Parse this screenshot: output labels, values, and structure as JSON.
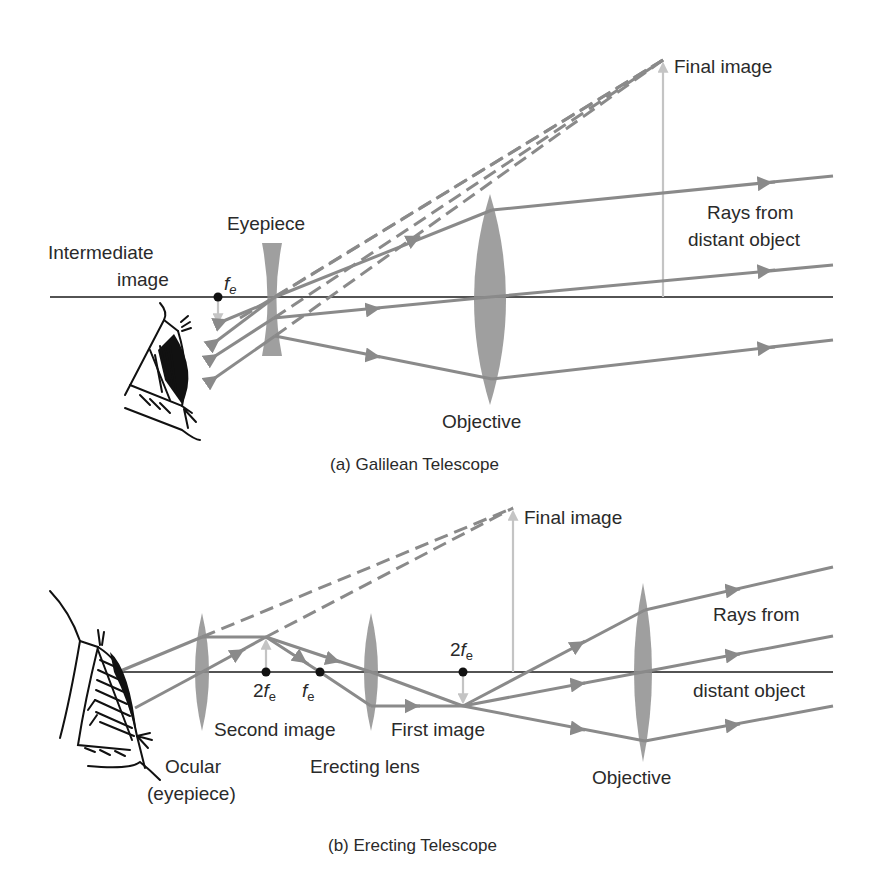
{
  "figure": {
    "colors": {
      "axis": "#1a1a1a",
      "ray": "#8a8a8a",
      "lens": "#8e8e8e",
      "image_arrow": "#c4c4c4",
      "text": "#2a2a2a",
      "background": "#ffffff"
    },
    "panel_a": {
      "caption": "(a) Galilean Telescope",
      "labels": {
        "final_image": "Final image",
        "rays_line1": "Rays from",
        "rays_line2": "distant object",
        "eyepiece": "Eyepiece",
        "intermediate_line1": "Intermediate",
        "intermediate_line2": "image",
        "focal_symbol": "f",
        "focal_subscript": "e",
        "objective": "Objective"
      }
    },
    "panel_b": {
      "caption": "(b) Erecting Telescope",
      "labels": {
        "final_image": "Final image",
        "rays_line1": "Rays from",
        "rays_line2": "distant object",
        "focal_2fe_prefix": "2",
        "focal_symbol": "f",
        "focal_subscript": "e",
        "second_image": "Second image",
        "first_image": "First image",
        "ocular_line1": "Ocular",
        "ocular_line2": "(eyepiece)",
        "erecting_lens": "Erecting lens",
        "objective": "Objective"
      }
    }
  }
}
